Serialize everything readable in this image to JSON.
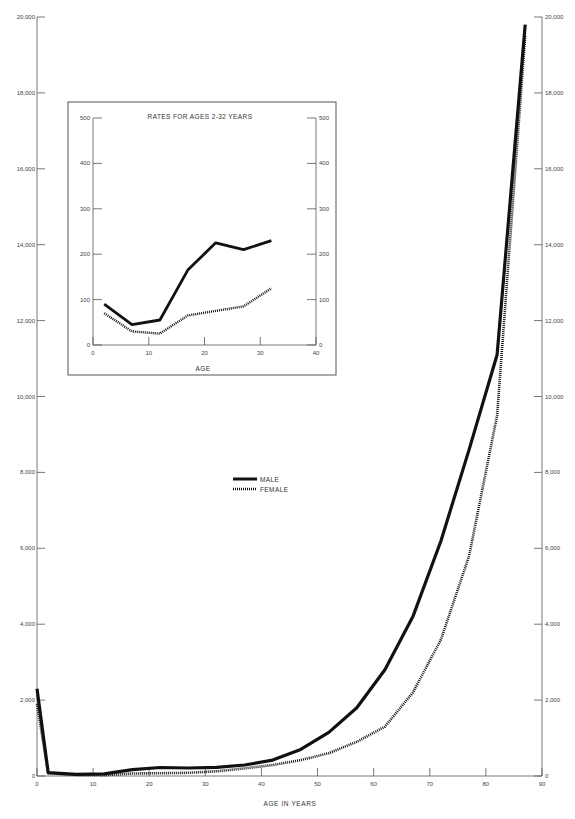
{
  "chart_data": [
    {
      "type": "line",
      "title": "",
      "xlabel": "AGE IN YEARS",
      "ylabel": "",
      "xlim": [
        0,
        90
      ],
      "ylim": [
        0,
        20000
      ],
      "x_ticks": [
        "0",
        "10",
        "20",
        "30",
        "40",
        "50",
        "60",
        "70",
        "80",
        "90"
      ],
      "y_ticks": [
        "0",
        "2,000",
        "4,000",
        "6,000",
        "8,000",
        "10,000",
        "12,000",
        "14,000",
        "16,000",
        "18,000",
        "20,000"
      ],
      "grid": false,
      "legend_position": "center",
      "x": [
        0,
        2,
        7,
        12,
        17,
        22,
        27,
        32,
        37,
        42,
        47,
        52,
        57,
        62,
        67,
        72,
        77,
        82,
        87
      ],
      "series": [
        {
          "name": "MALE",
          "style": "solid",
          "values": [
            2300,
            90,
            45,
            55,
            165,
            225,
            210,
            230,
            290,
            420,
            700,
            1150,
            1800,
            2800,
            4200,
            6200,
            8600,
            11100,
            19800
          ]
        },
        {
          "name": "FEMALE",
          "style": "dotted",
          "values": [
            1900,
            70,
            30,
            25,
            65,
            75,
            85,
            125,
            200,
            290,
            420,
            600,
            900,
            1300,
            2200,
            3600,
            5800,
            9500,
            19500
          ]
        }
      ]
    },
    {
      "type": "line",
      "title": "RATES FOR AGES 2-32 YEARS",
      "xlabel": "AGE",
      "ylabel": "",
      "xlim": [
        0,
        40
      ],
      "ylim": [
        0,
        500
      ],
      "x_ticks": [
        "0",
        "10",
        "20",
        "30",
        "40"
      ],
      "y_ticks": [
        "0",
        "100",
        "200",
        "300",
        "400",
        "500"
      ],
      "grid": false,
      "x": [
        2,
        7,
        12,
        17,
        22,
        27,
        32
      ],
      "series": [
        {
          "name": "MALE",
          "style": "solid",
          "values": [
            90,
            45,
            55,
            165,
            225,
            210,
            230
          ]
        },
        {
          "name": "FEMALE",
          "style": "dotted",
          "values": [
            70,
            30,
            25,
            65,
            75,
            85,
            125
          ]
        }
      ]
    }
  ],
  "main": {
    "xlabel": "AGE IN YEARS",
    "legend": {
      "male": "MALE",
      "female": "FEMALE"
    }
  },
  "inset": {
    "title": "RATES FOR AGES 2-32 YEARS",
    "xlabel": "AGE"
  },
  "colors": {
    "line": "#111111",
    "axis": "#555555",
    "text": "#444444"
  }
}
